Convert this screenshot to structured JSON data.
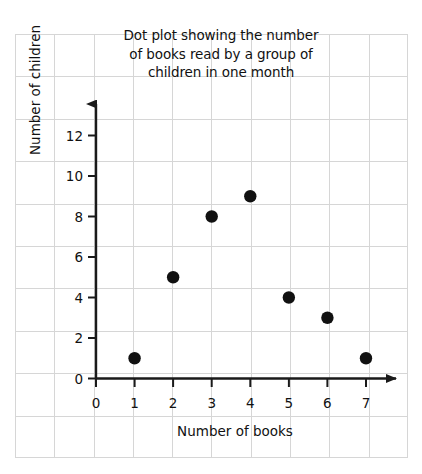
{
  "chart_data": {
    "type": "scatter",
    "title": "Dot plot showing the number of books read by a group of children in one month",
    "title_lines": [
      "Dot plot showing the number",
      "of books read by a group of",
      "children in one month"
    ],
    "xlabel": "Number of books",
    "ylabel": "Number of children",
    "x": [
      1,
      2,
      3,
      4,
      5,
      6,
      7
    ],
    "values": [
      1,
      5,
      8,
      9,
      4,
      3,
      1
    ],
    "points": [
      {
        "x": 1,
        "y": 1
      },
      {
        "x": 2,
        "y": 5
      },
      {
        "x": 3,
        "y": 8
      },
      {
        "x": 4,
        "y": 9
      },
      {
        "x": 5,
        "y": 4
      },
      {
        "x": 6,
        "y": 3
      },
      {
        "x": 7,
        "y": 1
      }
    ],
    "xlim": [
      0,
      7
    ],
    "ylim": [
      0,
      13
    ],
    "xticks": [
      "0",
      "1",
      "2",
      "3",
      "4",
      "5",
      "6",
      "7"
    ],
    "yticks": [
      "0",
      "2",
      "4",
      "6",
      "8",
      "10",
      "12"
    ],
    "grid": true,
    "legend": null,
    "marker_color": "#111111",
    "axis_color": "#1a1a1a",
    "grid_color": "#d6d6d6",
    "background_color": "#ffffff"
  }
}
